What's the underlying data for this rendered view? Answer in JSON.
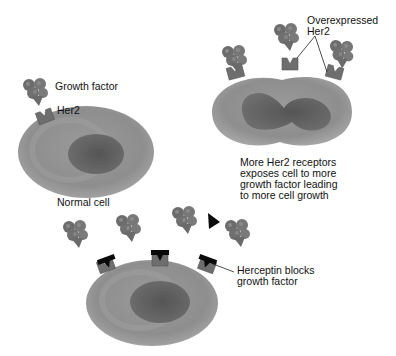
{
  "diagram": {
    "panels": [
      {
        "id": "normal",
        "caption": "Normal cell",
        "labels": {
          "ligand": "Growth factor",
          "receptor": "Her2"
        }
      },
      {
        "id": "overexpressed",
        "caption": "More Her2 receptors\nexposes cell to more\ngrowth factor leading\nto more cell growth",
        "labels": {
          "receptor": "Overexpressed\nHer2"
        }
      },
      {
        "id": "herceptin",
        "labels": {
          "drug": "Herceptin blocks\ngrowth factor"
        }
      }
    ],
    "icons": {
      "growth_factor": "growth-factor-cluster-icon",
      "receptor": "her2-receptor-icon",
      "drug": "herceptin-antibody-icon"
    },
    "colors": {
      "cell_body": "#8f8f8f",
      "cell_rim": "#a6a6a6",
      "nucleus": "#5e5e5e",
      "receptor": "#6e6e6e",
      "growth_factor": "#727272",
      "herceptin": "#0a0a0a",
      "text": "#111111"
    }
  }
}
